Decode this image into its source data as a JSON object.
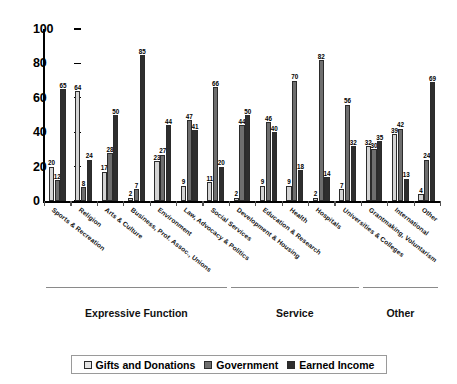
{
  "chart_data": {
    "type": "bar",
    "title": "",
    "subtitle": "",
    "xlabel": "",
    "ylabel": "",
    "ylim": [
      0,
      100
    ],
    "yticks": [
      0,
      20,
      40,
      60,
      80,
      100
    ],
    "grid": false,
    "legend_position": "bottom",
    "categories": [
      "Sports & Recreation",
      "Religion",
      "Arts & Culture",
      "Business, Prof. Assoc., Unions",
      "Environment",
      "Law, Advocacy & Politics",
      "Social Services",
      "Development & Housing",
      "Education & Research",
      "Health",
      "Hospitals",
      "Universities & Colleges",
      "Grantmaking, Voluntarism",
      "International",
      "Other"
    ],
    "series": [
      {
        "name": "Gifts and Donations",
        "color": "#d4d4d4",
        "values": [
          20,
          64,
          17,
          2,
          23,
          9,
          11,
          2,
          9,
          9,
          2,
          7,
          32,
          39,
          4
        ]
      },
      {
        "name": "Government",
        "color": "#6e6e6e",
        "values": [
          12,
          8,
          28,
          7,
          27,
          47,
          66,
          44,
          46,
          70,
          82,
          56,
          30,
          42,
          24
        ]
      },
      {
        "name": "Earned Income",
        "color": "#2e2e2e",
        "values": [
          65,
          24,
          50,
          85,
          44,
          41,
          20,
          50,
          40,
          18,
          14,
          32,
          35,
          13,
          69
        ]
      }
    ],
    "annotations": {
      "function_groups": [
        {
          "label": "Expressive Function",
          "start_index": 0,
          "end_index": 6
        },
        {
          "label": "Service",
          "start_index": 7,
          "end_index": 11
        },
        {
          "label": "Other",
          "start_index": 12,
          "end_index": 14
        }
      ]
    }
  },
  "legend": {
    "items": [
      {
        "label": "Gifts and Donations",
        "swatch": "light-gray-swatch"
      },
      {
        "label": "Government",
        "swatch": "medium-gray-swatch"
      },
      {
        "label": "Earned Income",
        "swatch": "dark-gray-swatch"
      }
    ]
  }
}
